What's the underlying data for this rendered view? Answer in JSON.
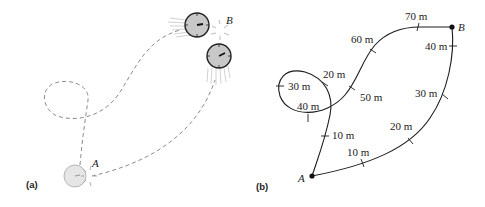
{
  "figure": {
    "panel_a": {
      "label": "(a)",
      "point_a": "A",
      "point_b": "B",
      "description": "Clock moved from A to B along two different dashed paths"
    },
    "panel_b": {
      "label": "(b)",
      "point_a": "A",
      "point_b": "B",
      "path_upper": {
        "ticks": [
          "10 m",
          "20 m",
          "30 m",
          "40 m",
          "50 m",
          "60 m",
          "70 m"
        ]
      },
      "path_lower": {
        "ticks": [
          "10 m",
          "20 m",
          "30 m",
          "40 m"
        ]
      }
    },
    "colors": {
      "line": "#1a1a1a",
      "dashed": "#8c8c8c",
      "clock_face": "#c8c8c8",
      "clock_faded": "#e6e6e6"
    }
  }
}
